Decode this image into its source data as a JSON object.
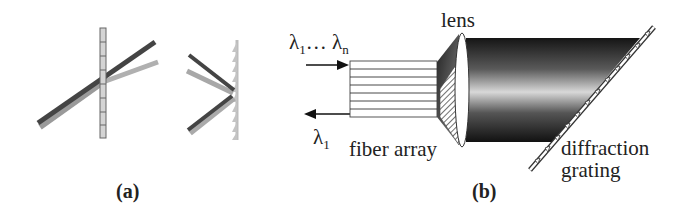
{
  "figure": {
    "panel_a": {
      "label": "(a)",
      "left_element": "transmission-grating",
      "right_element": "reflection-grating"
    },
    "panel_b": {
      "label": "(b)",
      "input_label_prefix": "λ",
      "input_label_sub1": "1",
      "input_label_dots": "… λ",
      "input_label_subn": "n",
      "output_label": "λ",
      "output_label_sub": "1",
      "fiber_array_label": "fiber array",
      "lens_label": "lens",
      "grating_label_line1": "diffraction",
      "grating_label_line2": "grating"
    }
  }
}
